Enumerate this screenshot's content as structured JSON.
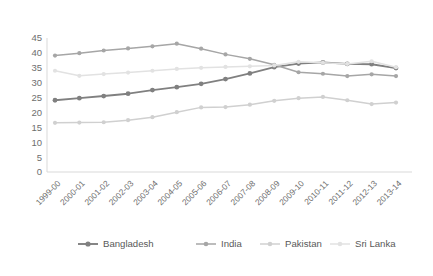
{
  "chart_data": {
    "type": "line",
    "title": "",
    "subtitle": "",
    "xlabel": "",
    "ylabel": "",
    "ylim": [
      0,
      45
    ],
    "yticks": [
      0,
      5,
      10,
      15,
      20,
      25,
      30,
      35,
      40,
      45
    ],
    "grid": false,
    "legend_position": "bottom",
    "categories": [
      "1999-00",
      "2000-01",
      "2001-02",
      "2002-03",
      "2003-04",
      "2004-05",
      "2005-06",
      "2006-07",
      "2007-08",
      "2008-09",
      "2009-10",
      "2010-11",
      "2011-12",
      "2012-13",
      "2013-14"
    ],
    "series": [
      {
        "name": "Bangladesh",
        "color": "#808080",
        "values": [
          24.1,
          24.8,
          25.5,
          26.3,
          27.5,
          28.5,
          29.6,
          31.2,
          33.1,
          35.2,
          36.4,
          36.8,
          36.3,
          36.2,
          34.9
        ]
      },
      {
        "name": "India",
        "color": "#a6a6a6",
        "values": [
          39.1,
          39.9,
          40.8,
          41.5,
          42.2,
          43.1,
          41.4,
          39.5,
          38.0,
          36.0,
          33.5,
          33.0,
          32.2,
          32.8,
          32.2
        ]
      },
      {
        "name": "Pakistan",
        "color": "#d0d0d0",
        "values": [
          16.5,
          16.6,
          16.7,
          17.4,
          18.4,
          20.1,
          21.7,
          21.8,
          22.6,
          23.9,
          24.8,
          25.2,
          24.1,
          22.8,
          23.3
        ]
      },
      {
        "name": "Sri Lanka",
        "color": "#e2e2e2",
        "values": [
          34.0,
          32.3,
          32.9,
          33.4,
          34.0,
          34.6,
          35.0,
          35.3,
          35.5,
          35.8,
          37.0,
          36.7,
          36.3,
          37.2,
          35.2
        ]
      }
    ]
  },
  "legend": {
    "items": [
      {
        "label": "Bangladesh"
      },
      {
        "label": "India"
      },
      {
        "label": "Pakistan"
      },
      {
        "label": "Sri Lanka"
      }
    ]
  }
}
